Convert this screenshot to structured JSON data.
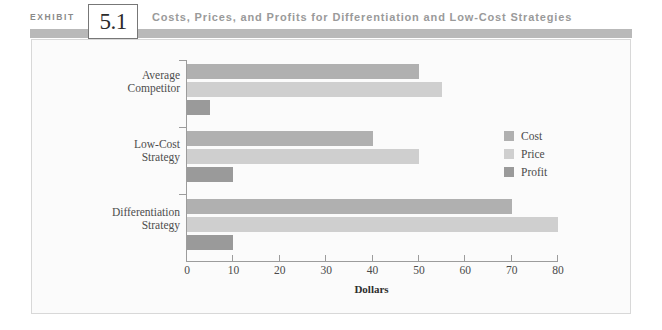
{
  "exhibit": {
    "kicker": "EXHIBIT",
    "number": "5.1",
    "title": "Costs, Prices, and Profits for Differentiation and Low-Cost Strategies"
  },
  "colors": {
    "cost": "#b0b0b0",
    "price": "#cfcfcf",
    "profit": "#9a9a9a",
    "rule": "#b9b9b9",
    "axis": "#9c9c9c",
    "frame_background": "#fbfbfb",
    "title_text": "#9a9a9a"
  },
  "chart_data": {
    "type": "bar",
    "orientation": "horizontal",
    "title": "Costs, Prices, and Profits for Differentiation and Low-Cost Strategies",
    "categories": [
      "Average Competitor",
      "Low-Cost Strategy",
      "Differentiation Strategy"
    ],
    "category_lines": [
      [
        "Average",
        "Competitor"
      ],
      [
        "Low-Cost",
        "Strategy"
      ],
      [
        "Differentiation",
        "Strategy"
      ]
    ],
    "series": [
      {
        "name": "Cost",
        "values": [
          50,
          40,
          70
        ],
        "color": "#b0b0b0"
      },
      {
        "name": "Price",
        "values": [
          55,
          50,
          80
        ],
        "color": "#cfcfcf"
      },
      {
        "name": "Profit",
        "values": [
          5,
          10,
          10
        ],
        "color": "#9a9a9a"
      }
    ],
    "xlabel": "Dollars",
    "ylabel": "",
    "xlim": [
      0,
      80
    ],
    "xticks": [
      0,
      10,
      20,
      30,
      40,
      50,
      60,
      70,
      80
    ],
    "xtick_labels": [
      "0",
      "10",
      "20",
      "30",
      "40",
      "50",
      "60",
      "70",
      "80"
    ],
    "grid": false,
    "legend": {
      "position": "right-middle",
      "entries": [
        "Cost",
        "Price",
        "Profit"
      ]
    }
  }
}
